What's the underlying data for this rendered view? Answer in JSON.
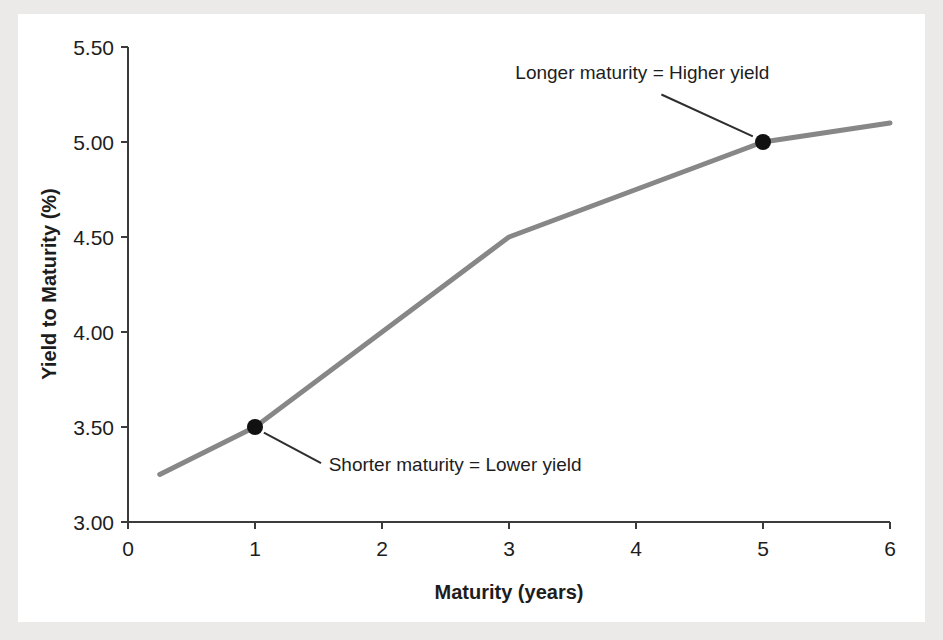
{
  "figure": {
    "background_color": "#eceae8",
    "card_color": "#ffffff"
  },
  "chart_data": {
    "type": "line",
    "title": "",
    "xlabel": "Maturity (years)",
    "ylabel": "Yield to Maturity (%)",
    "xlim": [
      0,
      6
    ],
    "ylim": [
      3.0,
      5.5
    ],
    "xticks": [
      "0",
      "1",
      "2",
      "3",
      "4",
      "5",
      "6"
    ],
    "xtick_values": [
      0,
      1,
      2,
      3,
      4,
      5,
      6
    ],
    "yticks": [
      "3.00",
      "3.50",
      "4.00",
      "4.50",
      "5.00",
      "5.50"
    ],
    "ytick_values": [
      3.0,
      3.5,
      4.0,
      4.5,
      5.0,
      5.5
    ],
    "grid": false,
    "legend": false,
    "line_color": "#878787",
    "marker_color": "#111111",
    "series": [
      {
        "name": "Yield curve",
        "x": [
          0.25,
          1,
          3,
          5,
          6
        ],
        "y": [
          3.25,
          3.5,
          4.5,
          5.0,
          5.1
        ]
      }
    ],
    "markers": [
      {
        "label": "shorter-maturity-point",
        "x": 1,
        "y": 3.5
      },
      {
        "label": "longer-maturity-point",
        "x": 5,
        "y": 5.0
      }
    ],
    "annotations": [
      {
        "name": "longer-maturity-annotation",
        "text": "Longer maturity = Higher yield",
        "text_x": 3.05,
        "text_y": 5.33,
        "leader_from_x": 4.2,
        "leader_from_y": 5.25,
        "leader_to_x": 4.92,
        "leader_to_y": 5.03
      },
      {
        "name": "shorter-maturity-annotation",
        "text": "Shorter maturity = Lower yield",
        "text_x": 1.58,
        "text_y": 3.27,
        "leader_from_x": 1.52,
        "leader_from_y": 3.31,
        "leader_to_x": 1.07,
        "leader_to_y": 3.47
      }
    ]
  }
}
